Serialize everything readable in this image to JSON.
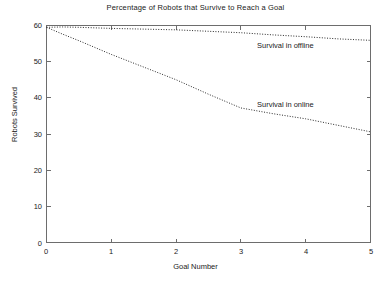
{
  "chart_data": {
    "type": "line",
    "title": "Percentage of Robots that Survive to Reach a Goal",
    "xlabel": "Goal Number",
    "ylabel": "Robots Survived",
    "xlim": [
      0,
      5
    ],
    "ylim": [
      0,
      60
    ],
    "grid": false,
    "legend_position": "inline-annotations",
    "x_ticks": [
      "0",
      "1",
      "2",
      "3",
      "4",
      "5"
    ],
    "y_ticks": [
      "0",
      "10",
      "20",
      "30",
      "40",
      "50",
      "60"
    ],
    "x": [
      0,
      0.25,
      0.5,
      1,
      1.5,
      2,
      2.5,
      3,
      3.5,
      4,
      4.5,
      5
    ],
    "series": [
      {
        "name": "Survival in offline",
        "style": "dotted",
        "color": "#2b2b2b",
        "values": [
          59.5,
          59.6,
          59.5,
          59.2,
          59.0,
          58.8,
          58.4,
          58.0,
          57.4,
          56.9,
          56.3,
          55.9
        ]
      },
      {
        "name": "Survival in online",
        "style": "dotted",
        "color": "#2b2b2b",
        "values": [
          59.5,
          57.6,
          55.8,
          52.0,
          48.5,
          45.0,
          41.0,
          37.2,
          35.6,
          34.2,
          32.4,
          30.6
        ]
      }
    ],
    "annotations": [
      {
        "text": "Survival in offline",
        "x": 3.9,
        "y": 54.0
      },
      {
        "text": "Survival in online",
        "x": 3.9,
        "y": 37.5
      }
    ]
  }
}
